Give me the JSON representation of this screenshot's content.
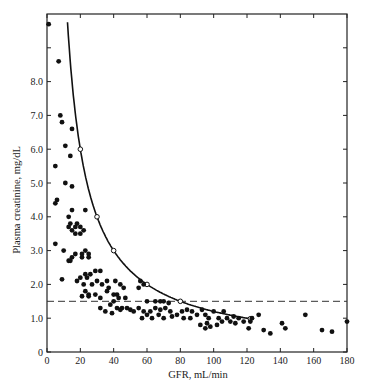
{
  "chart_data": {
    "type": "scatter",
    "title": "",
    "xlabel": "GFR, mL/min",
    "ylabel": "Plasma creatinine, mg/dL",
    "xlim": [
      0,
      180
    ],
    "ylim": [
      0,
      9
    ],
    "x_ticks": [
      0,
      20,
      40,
      60,
      80,
      100,
      120,
      140,
      160,
      180
    ],
    "y_ticks": [
      0,
      1.0,
      2.0,
      3.0,
      4.0,
      5.0,
      6.0,
      7.0,
      8.0
    ],
    "y_tick_labels": [
      "0",
      "1.0",
      "2.0",
      "3.0",
      "4.0",
      "5.0",
      "6.0",
      "7.0",
      "8.0"
    ],
    "grid": false,
    "legend": null,
    "reference_line": {
      "type": "dashed-horizontal",
      "y": 1.5
    },
    "theoretical_curve": {
      "name": "inverse relationship",
      "points": [
        [
          20,
          6.0
        ],
        [
          30,
          4.0
        ],
        [
          40,
          3.0
        ],
        [
          60,
          2.0
        ],
        [
          80,
          1.5
        ],
        [
          122,
          1.0
        ]
      ]
    },
    "series": [
      {
        "name": "patients",
        "marker": "filled-circle",
        "points": [
          [
            1,
            9.7
          ],
          [
            7,
            8.6
          ],
          [
            8,
            7.0
          ],
          [
            9,
            6.8
          ],
          [
            15,
            6.6
          ],
          [
            11,
            6.1
          ],
          [
            14,
            5.8
          ],
          [
            5,
            5.5
          ],
          [
            11,
            5.0
          ],
          [
            15,
            4.9
          ],
          [
            6,
            4.5
          ],
          [
            5,
            4.4
          ],
          [
            15,
            4.2
          ],
          [
            23,
            4.2
          ],
          [
            13,
            4.0
          ],
          [
            14,
            3.8
          ],
          [
            18,
            3.8
          ],
          [
            17,
            3.7
          ],
          [
            20,
            3.7
          ],
          [
            13,
            3.7
          ],
          [
            22,
            3.6
          ],
          [
            15,
            3.6
          ],
          [
            17,
            3.5
          ],
          [
            20,
            3.5
          ],
          [
            5,
            3.2
          ],
          [
            10,
            3.0
          ],
          [
            17,
            2.9
          ],
          [
            21,
            2.9
          ],
          [
            23,
            3.0
          ],
          [
            25,
            2.9
          ],
          [
            15,
            2.8
          ],
          [
            21,
            2.8
          ],
          [
            25,
            2.8
          ],
          [
            13,
            2.7
          ],
          [
            14,
            2.7
          ],
          [
            29,
            2.4
          ],
          [
            32,
            2.4
          ],
          [
            23,
            2.3
          ],
          [
            26,
            2.3
          ],
          [
            20,
            2.2
          ],
          [
            24,
            2.2
          ],
          [
            30,
            2.1
          ],
          [
            33,
            2.0
          ],
          [
            36,
            2.1
          ],
          [
            41,
            2.1
          ],
          [
            44,
            2.0
          ],
          [
            9,
            2.15
          ],
          [
            18,
            2.1
          ],
          [
            22,
            2.0
          ],
          [
            27,
            2.0
          ],
          [
            37,
            1.9
          ],
          [
            42,
            1.7
          ],
          [
            46,
            1.9
          ],
          [
            23,
            1.8
          ],
          [
            25,
            1.7
          ],
          [
            29,
            1.7
          ],
          [
            36,
            1.8
          ],
          [
            40,
            1.7
          ],
          [
            43,
            1.6
          ],
          [
            40,
            1.5
          ],
          [
            38,
            1.4
          ],
          [
            45,
            1.3
          ],
          [
            48,
            1.3
          ],
          [
            21,
            1.65
          ],
          [
            25,
            1.65
          ],
          [
            32,
            1.6
          ],
          [
            47,
            1.6
          ],
          [
            56,
            2.1
          ],
          [
            58,
            2.0
          ],
          [
            55,
            1.9
          ],
          [
            32,
            1.3
          ],
          [
            35,
            1.2
          ],
          [
            39,
            1.15
          ],
          [
            42,
            1.3
          ],
          [
            44,
            1.25
          ],
          [
            50,
            1.25
          ],
          [
            52,
            1.2
          ],
          [
            55,
            1.3
          ],
          [
            58,
            1.2
          ],
          [
            62,
            1.2
          ],
          [
            65,
            1.3
          ],
          [
            68,
            1.25
          ],
          [
            71,
            1.3
          ],
          [
            74,
            1.2
          ],
          [
            60,
            1.5
          ],
          [
            65,
            1.5
          ],
          [
            68,
            1.5
          ],
          [
            70,
            1.5
          ],
          [
            73,
            1.45
          ],
          [
            57,
            1.0
          ],
          [
            60,
            1.1
          ],
          [
            63,
            1.0
          ],
          [
            67,
            1.1
          ],
          [
            70,
            1.0
          ],
          [
            75,
            1.05
          ],
          [
            78,
            1.1
          ],
          [
            81,
            1.2
          ],
          [
            84,
            1.25
          ],
          [
            87,
            1.2
          ],
          [
            90,
            1.1
          ],
          [
            93,
            1.25
          ],
          [
            95,
            1.1
          ],
          [
            97,
            1.0
          ],
          [
            100,
            1.2
          ],
          [
            103,
            1.0
          ],
          [
            106,
            1.2
          ],
          [
            108,
            1.0
          ],
          [
            112,
            1.05
          ],
          [
            115,
            1.0
          ],
          [
            82,
            1.0
          ],
          [
            86,
            1.0
          ],
          [
            92,
            0.8
          ],
          [
            95,
            0.7
          ],
          [
            98,
            0.75
          ],
          [
            102,
            0.8
          ],
          [
            105,
            0.9
          ],
          [
            110,
            0.9
          ],
          [
            113,
            0.85
          ],
          [
            96,
            0.85
          ],
          [
            118,
            0.9
          ],
          [
            121,
            0.7
          ],
          [
            122,
            0.9
          ],
          [
            123,
            1.0
          ],
          [
            127,
            1.1
          ],
          [
            130,
            0.65
          ],
          [
            134,
            0.55
          ],
          [
            141,
            0.85
          ],
          [
            143,
            0.7
          ],
          [
            155,
            1.1
          ],
          [
            165,
            0.65
          ],
          [
            171,
            0.6
          ],
          [
            180,
            0.9
          ]
        ]
      }
    ]
  }
}
